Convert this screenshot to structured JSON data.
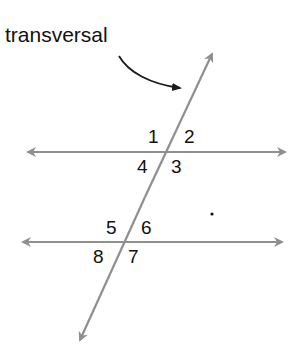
{
  "diagram": {
    "title_label": "transversal",
    "colors": {
      "line": "#8f8f8f",
      "text": "#111111",
      "pointer": "#1a1a1a"
    },
    "angles": [
      {
        "label": "1",
        "x": 148,
        "y": 127
      },
      {
        "label": "2",
        "x": 184,
        "y": 127
      },
      {
        "label": "4",
        "x": 137,
        "y": 157
      },
      {
        "label": "3",
        "x": 171,
        "y": 157
      },
      {
        "label": "5",
        "x": 106,
        "y": 218
      },
      {
        "label": "6",
        "x": 141,
        "y": 218
      },
      {
        "label": "8",
        "x": 93,
        "y": 247
      },
      {
        "label": "7",
        "x": 128,
        "y": 247
      }
    ],
    "dot": "."
  }
}
